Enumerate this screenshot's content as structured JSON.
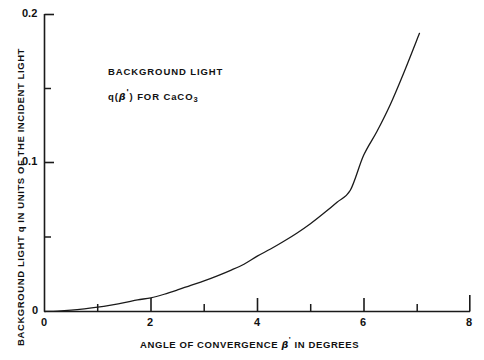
{
  "chart_data": {
    "type": "line",
    "title": "",
    "xlabel": "ANGLE OF CONVERGENCE β' IN DEGREES",
    "ylabel": "BACKGROUND LIGHT q IN UNITS OF THE INCIDENT LIGHT",
    "xlim": [
      0,
      8
    ],
    "ylim": [
      0,
      0.2
    ],
    "grid": false,
    "legend": "none",
    "x_major_ticks": [
      0,
      2,
      4,
      6,
      8
    ],
    "x_major_tick_labels": [
      "0",
      "2",
      "4",
      "6",
      "8"
    ],
    "x_minor_ticks": [
      1,
      3,
      5,
      7
    ],
    "y_major_ticks": [
      0,
      0.1,
      0.2
    ],
    "y_major_tick_labels": [
      "0",
      "0.1",
      "0.2"
    ],
    "y_minor_ticks": [
      0.05,
      0.15
    ],
    "series": [
      {
        "name": "q(β') for CaCO3",
        "x": [
          0.0,
          0.25,
          0.5,
          0.75,
          1.0,
          1.25,
          1.5,
          1.75,
          2.0,
          2.25,
          2.5,
          2.75,
          3.0,
          3.25,
          3.5,
          3.75,
          4.0,
          4.25,
          4.5,
          4.75,
          5.0,
          5.25,
          5.5,
          5.75,
          6.0,
          6.25,
          6.5,
          6.75,
          7.05
        ],
        "y": [
          0.0,
          0.0003,
          0.0009,
          0.0018,
          0.0029,
          0.0043,
          0.0059,
          0.0078,
          0.0092,
          0.0116,
          0.0145,
          0.0176,
          0.0206,
          0.024,
          0.0277,
          0.0318,
          0.0372,
          0.042,
          0.0472,
          0.0528,
          0.059,
          0.066,
          0.0735,
          0.0815,
          0.105,
          0.121,
          0.139,
          0.16,
          0.187
        ]
      }
    ],
    "annotations": [
      {
        "id": "annotation-background-light",
        "text": "BACKGROUND LIGHT",
        "x_data": 1.9,
        "y_data": 0.166
      },
      {
        "id": "annotation-formula",
        "text": "q(β') FOR CaCO3",
        "text_parts": {
          "prefix": "q(",
          "beta": "β",
          "prime": "'",
          "middle": ") FOR CaCO",
          "subscript": "3"
        },
        "x_data": 1.9,
        "y_data": 0.151
      }
    ],
    "line_color": "#1a1a1a",
    "line_width": 1.3,
    "background_color": "#ffffff",
    "axis_color": "#1a1a1a",
    "spines": [
      "left",
      "bottom"
    ]
  },
  "axis_titles": {
    "y_prefix": "BACKGROUND LIGHT q IN UNITS OF THE INCIDENT LIGHT",
    "x_prefix": "ANGLE OF CONVERGENCE ",
    "x_beta": "β",
    "x_prime": "'",
    "x_suffix": " IN DEGREES"
  },
  "y_tick_labels": {
    "t0": "0",
    "t1": "0.1",
    "t2": "0.2"
  },
  "x_tick_labels": {
    "t0": "0",
    "t2": "2",
    "t4": "4",
    "t6": "6",
    "t8": "8"
  },
  "annotation_text": {
    "line1": "BACKGROUND LIGHT",
    "line2_prefix": "q(",
    "line2_beta": "β",
    "line2_prime": "'",
    "line2_middle": ") FOR CaCO",
    "line2_sub": "3"
  }
}
